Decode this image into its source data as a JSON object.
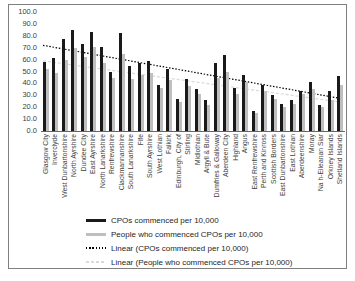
{
  "window": {
    "background": "#ffffff",
    "frame_border_color": "#7f7f7f"
  },
  "chart_data": {
    "type": "bar",
    "title": "",
    "xlabel": "",
    "ylabel": "",
    "ylim": [
      0,
      100
    ],
    "ytick_step": 10,
    "ytick_labels": [
      "100.0",
      "90.0",
      "80.0",
      "70.0",
      "60.0",
      "50.0",
      "40.0",
      "30.0",
      "20.0",
      "10.0",
      "0.0"
    ],
    "grid": false,
    "legend_position": "bottom-left",
    "categories": [
      "Glasgow City",
      "Inverclyde",
      "West Dunbartonshire",
      "North Ayrshire",
      "Dundee City",
      "East Ayrshire",
      "North Lanarkshire",
      "Renfrewshire",
      "Clackmannanshire",
      "South Lanarkshire",
      "Fife",
      "South Ayrshire",
      "West Lothian",
      "Falkirk",
      "Edinburgh, City of",
      "Stirling",
      "Midlothian",
      "Argyll & Bute",
      "Dumfries & Galloway",
      "Aberdeen City",
      "Highland",
      "Angus",
      "East Renfrewshire",
      "Perth and Kinross",
      "Scottish Borders",
      "East Dunbartonshire",
      "East Lothian",
      "Aberdeenshire",
      "Moray",
      "Na h-Eileanan Siar",
      "Orkney Islands",
      "Shetland Islands"
    ],
    "series": [
      {
        "name": "CPOs commenced per 10,000",
        "color": "#1a1a1a",
        "values": [
          58,
          61,
          77,
          85,
          73,
          83,
          71,
          50,
          82,
          55,
          57,
          59,
          39,
          52,
          27,
          44,
          35,
          26,
          57,
          64,
          36,
          47,
          17,
          39,
          30,
          23,
          26,
          34,
          41,
          22,
          34,
          46
        ]
      },
      {
        "name": "People who commenced CPOs per 10,000",
        "color": "#bfbfbf",
        "values": [
          52,
          49,
          60,
          70,
          62,
          71,
          57,
          45,
          65,
          44,
          47,
          49,
          36,
          43,
          24,
          38,
          31,
          22,
          45,
          50,
          31,
          41,
          15,
          34,
          27,
          20,
          23,
          31,
          35,
          20,
          26,
          39
        ]
      }
    ],
    "trendlines": [
      {
        "name": "Linear (CPOs commenced per 10,000)",
        "color": "#000000",
        "style": "dotted",
        "start_value": 72,
        "end_value": 27
      },
      {
        "name": "Linear (People who commenced CPOs per 10,000)",
        "color": "#d9d9d9",
        "style": "dashed",
        "start_value": 59,
        "end_value": 24
      }
    ]
  }
}
